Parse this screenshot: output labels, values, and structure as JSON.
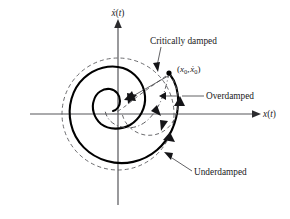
{
  "figure": {
    "type": "phase-plane-diagram",
    "background_color": "#ffffff",
    "curve_color": "#000000",
    "guide_color": "#5a5a5e",
    "axis_color": "#56565a"
  },
  "axes": {
    "horizontal": {
      "name": "x-axis",
      "label_base": "x",
      "label_arg": "(t)",
      "label_full": "x(t)",
      "direction": "right",
      "has_arrowhead": true
    },
    "vertical": {
      "name": "xdot-axis",
      "label_base": "x",
      "label_dot": "̇",
      "label_arg": "(t)",
      "label_full": "ẋ(t)",
      "direction": "up",
      "has_arrowhead": true
    },
    "origin": {
      "x": 118,
      "y": 114
    }
  },
  "initial_point": {
    "name": "initial-condition-point",
    "label_open": "(",
    "label_x": "x",
    "label_x_sub": "0",
    "label_comma": ", ",
    "label_xdot": "ẋ",
    "label_xdot_sub": "0",
    "label_close": ")",
    "label_full": "(x₀, ẋ₀)",
    "position": {
      "x": 169,
      "y": 73
    }
  },
  "annotations": [
    {
      "id": "critically-damped",
      "label": "Critically damped",
      "linestyle": "dash-dot",
      "text_position": {
        "x": 150,
        "y": 44
      },
      "leader_to": {
        "x": 163,
        "y": 70
      }
    },
    {
      "id": "overdamped",
      "label": "Overdamped",
      "linestyle": "dashed",
      "text_position": {
        "x": 206,
        "y": 96
      },
      "leader_to": {
        "x": 160,
        "y": 97
      }
    },
    {
      "id": "underdamped",
      "label": "Underdamped",
      "linestyle": "solid",
      "text_position": {
        "x": 194,
        "y": 172
      },
      "leader_to": {
        "x": 158,
        "y": 150
      }
    }
  ],
  "curves": {
    "reference_circle": {
      "name": "reference-circle",
      "style": "dashed",
      "center": {
        "x": 118,
        "y": 114
      },
      "radius": 56
    },
    "underdamped_spiral": {
      "name": "underdamped-spiral",
      "style": "solid",
      "description": "inward logarithmic spiral from the initial point to the origin"
    },
    "critically_damped_path": {
      "name": "critically-damped-path",
      "style": "dash-dot",
      "description": "direct decaying path from the initial point to the origin"
    },
    "overdamped_path": {
      "name": "overdamped-path",
      "style": "dashed",
      "description": "slow, non-oscillatory path from the initial point to the origin"
    }
  },
  "direction_arrows": {
    "name": "flow-direction-arrows",
    "count": 6,
    "description": "arrowheads indicating direction of motion along each trajectory"
  }
}
